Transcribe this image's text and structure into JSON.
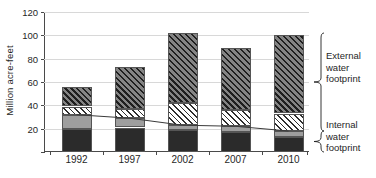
{
  "chart_data": {
    "type": "bar",
    "title": "",
    "subtitle": "",
    "xlabel": "",
    "ylabel": "Million acre-feet",
    "categories": [
      "1992",
      "1997",
      "2002",
      "2007",
      "2010"
    ],
    "ylim": [
      0,
      120
    ],
    "yticks": [
      0,
      20,
      40,
      60,
      80,
      100,
      120
    ],
    "ytick_labels": [
      "",
      "20",
      "40",
      "60",
      "80",
      "100",
      "120"
    ],
    "grid": true,
    "stacked": true,
    "legend_position": "right",
    "series": [
      {
        "name": "Internal water footprint - dark",
        "group": "Internal water footprint",
        "pattern": "solid-dark",
        "color": "#2b2b2b",
        "values": [
          20,
          21,
          19,
          17,
          13
        ]
      },
      {
        "name": "Internal water footprint - gray",
        "group": "Internal water footprint",
        "pattern": "solid-gray",
        "color": "#9e9e9e",
        "values": [
          12,
          8,
          4,
          5,
          5
        ]
      },
      {
        "name": "External water footprint - white hatched",
        "group": "External water footprint",
        "pattern": "white-diagonal-hatch",
        "color": "#ffffff",
        "values": [
          7,
          8,
          19,
          14,
          15
        ]
      },
      {
        "name": "External water footprint - dark hatched",
        "group": "External water footprint",
        "pattern": "dark-diagonal-hatch",
        "color": "#6f6f6f",
        "values": [
          17,
          36,
          60,
          53,
          67
        ]
      }
    ],
    "totals": [
      56,
      73,
      102,
      89,
      100
    ],
    "trend_line": {
      "name": "Internal water footprint trend",
      "color": "#3a3a3a",
      "values": [
        32,
        29,
        23,
        22,
        18
      ]
    },
    "annotations": [
      {
        "id": "external",
        "label_lines": [
          "External",
          "water",
          "footprint"
        ],
        "brace": "curly-right"
      },
      {
        "id": "internal",
        "label_lines": [
          "Internal",
          "water",
          "footprint"
        ],
        "brace": "curly-right"
      }
    ]
  },
  "axes": {
    "y_title": "Million acre-feet"
  },
  "legend": {
    "external": {
      "line1": "External",
      "line2": "water",
      "line3": "footprint"
    },
    "internal": {
      "line1": "Internal",
      "line2": "water",
      "line3": "footprint"
    }
  }
}
